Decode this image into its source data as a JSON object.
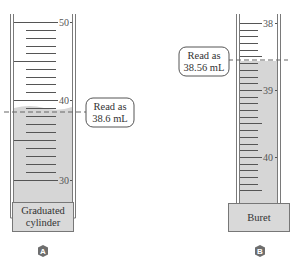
{
  "colors": {
    "liquid": "#d6d6d6",
    "wall": "#7a7a7a",
    "tick": "#555555",
    "dashed_line": "#666666",
    "label_box_fill": "#d9d9d9",
    "badge": "#6e6e6e"
  },
  "cylinder": {
    "name": "Graduated cylinder",
    "label_line1": "Graduated",
    "label_line2": "cylinder",
    "badge": "A",
    "tick_labels": [
      "50",
      "40",
      "30"
    ],
    "label_50": "50",
    "label_40": "40",
    "label_30": "30",
    "callout_line1": "Read as",
    "callout_line2": "38.6 mL",
    "reading_value": 38.6,
    "reading_unit": "mL",
    "scale_min": 30,
    "scale_max": 50,
    "minor_tick_step": 1
  },
  "buret": {
    "name": "Buret",
    "label": "Buret",
    "badge": "B",
    "tick_labels": [
      "38",
      "39",
      "40"
    ],
    "label_38": "38",
    "label_39": "39",
    "label_40": "40",
    "callout_line1": "Read as",
    "callout_line2": "38.56 mL",
    "reading_value": 38.56,
    "reading_unit": "mL",
    "scale_min": 38,
    "scale_max": 40,
    "minor_tick_step": 0.1
  }
}
